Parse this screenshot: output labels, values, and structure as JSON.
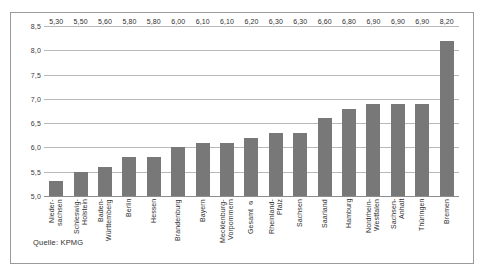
{
  "source_note": "Quelle: KPMG",
  "chart_data": {
    "type": "bar",
    "title": "",
    "xlabel": "",
    "ylabel": "",
    "ylim": [
      5.0,
      8.5
    ],
    "ytick_labels": [
      "8,5",
      "8,0",
      "7,5",
      "7,0",
      "6,5",
      "6,0",
      "5,5",
      "5,0"
    ],
    "ytick_values": [
      8.5,
      8.0,
      7.5,
      7.0,
      6.5,
      6.0,
      5.5,
      5.0
    ],
    "grid": true,
    "legend": "none",
    "categories": [
      "Nieder-\nsachsen",
      "Schleswig-\nHolstein",
      "Baden-\nWürttemberg",
      "Berlin",
      "Hessen",
      "Brandenburg",
      "Bayern",
      "Mecklenburg-\nVorpommern",
      "Gesamt ⌀",
      "Rheinland-\nPfalz",
      "Sachsen",
      "Saarland",
      "Hamburg",
      "Nordrhein-\nWestfalen",
      "Sachsen-\nAnhalt",
      "Thüringen",
      "Bremen"
    ],
    "values": [
      5.3,
      5.5,
      5.6,
      5.8,
      5.8,
      6.0,
      6.1,
      6.1,
      6.2,
      6.3,
      6.3,
      6.6,
      6.8,
      6.9,
      6.9,
      6.9,
      8.2
    ],
    "value_labels": [
      "5,30",
      "5,50",
      "5,60",
      "5,80",
      "5,80",
      "6,00",
      "6,10",
      "6,10",
      "6,20",
      "6,30",
      "6,30",
      "6,60",
      "6,80",
      "6,90",
      "6,90",
      "6,90",
      "8,20"
    ],
    "bar_color": "#787878",
    "gridline_color": "#b9b9b9"
  }
}
